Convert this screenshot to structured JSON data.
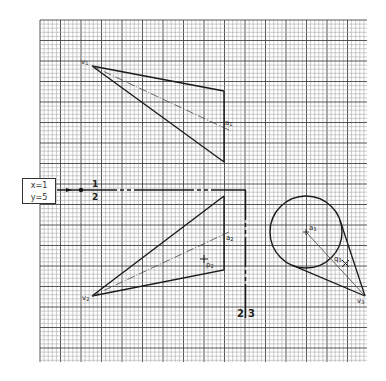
{
  "grid": {
    "x0": 40,
    "y0": 20,
    "x1": 367,
    "y1": 362,
    "minor_step": 4.1,
    "major_every": 5,
    "minor_color": "#9a9a9a",
    "major_color": "#444444"
  },
  "info_box": {
    "line1": "x=1",
    "line2": "y=5"
  },
  "divider_labels": {
    "h_top": "1",
    "h_bottom": "2",
    "v_left": "2",
    "v_right": "3"
  },
  "panels": [
    {
      "id": 1,
      "vertex": {
        "label": "v",
        "sub": "1",
        "x": 92,
        "y": 66
      },
      "axis": {
        "label": "a",
        "sub": "1",
        "end_x": 231,
        "end_y": 131
      },
      "shape": "triangle",
      "points": [
        [
          92,
          66
        ],
        [
          224,
          91
        ],
        [
          224,
          162
        ]
      ]
    },
    {
      "id": 2,
      "vertex": {
        "label": "v",
        "sub": "2",
        "x": 92,
        "y": 296
      },
      "axis": {
        "label": "a",
        "sub": "2",
        "end_x": 229,
        "end_y": 232
      },
      "shape": "triangle",
      "points": [
        [
          92,
          296
        ],
        [
          224,
          196
        ],
        [
          224,
          270
        ]
      ],
      "point": {
        "label": "p",
        "sub": "2",
        "x": 204,
        "y": 259
      }
    },
    {
      "id": 3,
      "vertex": {
        "label": "v",
        "sub": "3",
        "x": 365,
        "y": 296
      },
      "axis": {
        "label": "a",
        "sub": "3",
        "start_x": 306,
        "start_y": 232
      },
      "shape": "circle-cone",
      "circle": {
        "cx": 306,
        "cy": 232,
        "r": 36
      },
      "point": {
        "label": "q",
        "sub": "3",
        "x": 346,
        "y": 264
      }
    }
  ]
}
